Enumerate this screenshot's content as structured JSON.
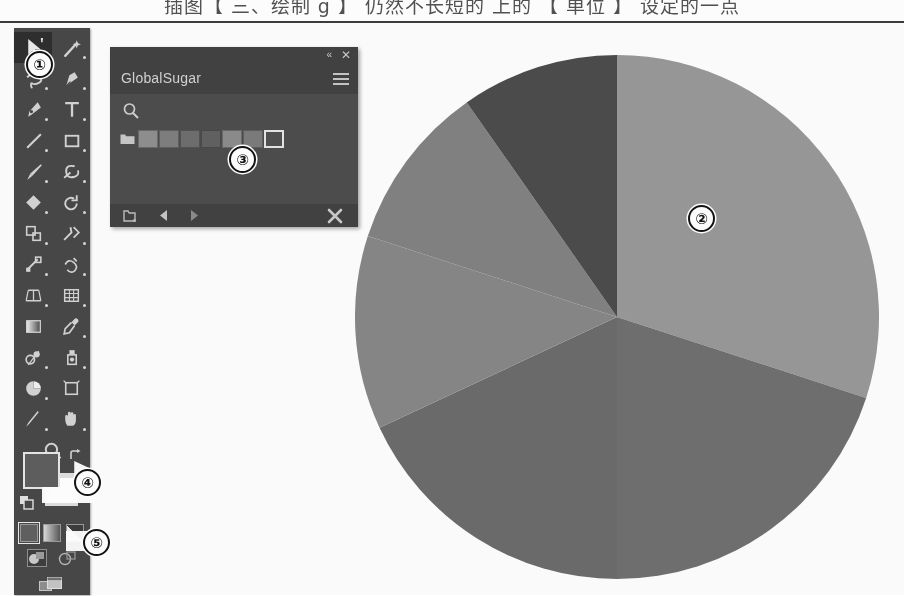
{
  "page": {
    "top_text": "插图【 三、绘制 g 】 仍然不长短的 上的 【 单位 】 设定的一点"
  },
  "app": {
    "name": "illustrator-workspace",
    "canvas_bg": "#fdfdfd"
  },
  "toolbar": {
    "name": "tools-panel",
    "bg": "#46464a",
    "selected_tool": "selection-tool",
    "tools": [
      {
        "id": "selection-tool",
        "icon": "cursor-arrow-plus-icon",
        "selected": true,
        "flyout": true
      },
      {
        "id": "direct-selection-tool",
        "icon": "magic-wand-icon",
        "selected": false,
        "flyout": true
      },
      {
        "id": "lasso-tool",
        "icon": "lasso-icon",
        "selected": false,
        "flyout": true
      },
      {
        "id": "pen-tool",
        "icon": "pen-nib-icon",
        "selected": false,
        "flyout": true
      },
      {
        "id": "curvature-tool",
        "icon": "curvature-pen-icon",
        "selected": false,
        "flyout": true
      },
      {
        "id": "type-tool",
        "icon": "type-T-icon",
        "selected": false,
        "flyout": true
      },
      {
        "id": "line-segment-tool",
        "icon": "diagonal-line-icon",
        "selected": false,
        "flyout": true
      },
      {
        "id": "rectangle-tool",
        "icon": "rectangle-icon",
        "selected": false,
        "flyout": true
      },
      {
        "id": "paintbrush-tool",
        "icon": "paintbrush-icon",
        "selected": false,
        "flyout": true
      },
      {
        "id": "shaper-tool",
        "icon": "shaper-loop-icon",
        "selected": false,
        "flyout": true
      },
      {
        "id": "eraser-tool",
        "icon": "eraser-diamond-icon",
        "selected": false,
        "flyout": true
      },
      {
        "id": "rotate-tool",
        "icon": "rotate-arrow-icon",
        "selected": false,
        "flyout": true
      },
      {
        "id": "scale-tool",
        "icon": "scale-squares-icon",
        "selected": false,
        "flyout": true
      },
      {
        "id": "width-tool",
        "icon": "width-bowtie-icon",
        "selected": false,
        "flyout": true
      },
      {
        "id": "free-transform-tool",
        "icon": "free-transform-icon",
        "selected": false,
        "flyout": true
      },
      {
        "id": "shape-builder-tool",
        "icon": "shape-builder-icon",
        "selected": false,
        "flyout": true
      },
      {
        "id": "perspective-grid-tool",
        "icon": "perspective-grid-icon",
        "selected": false,
        "flyout": true
      },
      {
        "id": "mesh-tool",
        "icon": "mesh-grid-icon",
        "selected": false,
        "flyout": true
      },
      {
        "id": "gradient-tool",
        "icon": "gradient-square-icon",
        "selected": false,
        "flyout": false
      },
      {
        "id": "eyedropper-tool",
        "icon": "eyedropper-icon",
        "selected": false,
        "flyout": true
      },
      {
        "id": "blend-tool",
        "icon": "blend-icon",
        "selected": false,
        "flyout": true
      },
      {
        "id": "symbol-sprayer-tool",
        "icon": "symbol-sprayer-icon",
        "selected": false,
        "flyout": true
      },
      {
        "id": "column-graph-tool",
        "icon": "pie-graph-icon",
        "selected": false,
        "flyout": true
      },
      {
        "id": "artboard-tool",
        "icon": "artboard-icon",
        "selected": false,
        "flyout": false
      },
      {
        "id": "slice-tool",
        "icon": "slice-knife-icon",
        "selected": false,
        "flyout": true
      },
      {
        "id": "hand-tool",
        "icon": "hand-icon",
        "selected": false,
        "flyout": true
      },
      {
        "id": "zoom-tool",
        "icon": "magnifier-icon",
        "selected": false,
        "flyout": false
      }
    ],
    "fill_stroke": {
      "fill_color": "#5c5c60",
      "stroke_color": "#ffffff",
      "swap_icon": "swap-fill-stroke-icon",
      "default_icon": "default-fill-stroke-icon"
    },
    "color_modes": [
      {
        "id": "color-mode",
        "icon": "solid-color-icon",
        "selected": true
      },
      {
        "id": "gradient-mode",
        "icon": "gradient-icon",
        "selected": false
      },
      {
        "id": "none-mode",
        "icon": "none-slash-icon",
        "selected": false
      }
    ],
    "draw_modes": [
      {
        "id": "draw-normal",
        "icon": "draw-normal-icon",
        "selected": true
      },
      {
        "id": "draw-behind",
        "icon": "draw-behind-icon",
        "selected": false
      }
    ],
    "screen_mode": {
      "id": "screen-mode",
      "icon": "screen-mode-icon"
    }
  },
  "swatch_panel": {
    "title": "GlobalSugar",
    "titlebar": {
      "collapse_icon": "double-chevron-left-icon",
      "close_icon": "close-x-icon",
      "menu_icon": "panel-menu-hamburger-icon"
    },
    "search_icon": "search-magnifier-icon",
    "folder_icon": "swatch-folder-icon",
    "swatches": [
      {
        "id": "swatch-1",
        "color": "#8d8d8d",
        "selected": false
      },
      {
        "id": "swatch-2",
        "color": "#7d7d7d",
        "selected": false
      },
      {
        "id": "swatch-3",
        "color": "#6d6d6d",
        "selected": false
      },
      {
        "id": "swatch-4",
        "color": "#5f5f5f",
        "selected": false
      },
      {
        "id": "swatch-5",
        "color": "#8a8a8a",
        "selected": false
      },
      {
        "id": "swatch-6",
        "color": "#7a7a7a",
        "selected": false
      },
      {
        "id": "swatch-7",
        "color": "#4e4e52",
        "selected": true
      }
    ],
    "footer": [
      {
        "id": "libraries-button",
        "icon": "swatch-libraries-icon"
      },
      {
        "id": "previous-button",
        "icon": "triangle-left-icon"
      },
      {
        "id": "next-button",
        "icon": "triangle-right-icon"
      },
      {
        "id": "delete-swatch",
        "icon": "delete-x-icon"
      }
    ]
  },
  "chart_data": {
    "type": "pie",
    "title": "",
    "center": {
      "x": 262,
      "y": 294
    },
    "radius": 262,
    "start_angle_deg": 0,
    "direction": "clockwise",
    "legend": "none",
    "labels": [
      "Slice 1",
      "Slice 2",
      "Slice 3",
      "Slice 4",
      "Slice 5",
      "Slice 6"
    ],
    "values": [
      30,
      20,
      18,
      12,
      10,
      10
    ],
    "percentages": [
      30,
      20,
      18,
      12,
      10,
      10
    ],
    "colors": [
      "#969696",
      "#6e6e6e",
      "#6a6a6a",
      "#858585",
      "#808080",
      "#4a4a4a"
    ],
    "slice_angles_deg": [
      108,
      72,
      65,
      43,
      37,
      35
    ]
  },
  "callouts": [
    {
      "id": "callout-1",
      "label": "①",
      "target": "tools-panel"
    },
    {
      "id": "callout-2",
      "label": "②",
      "target": "pie-chart"
    },
    {
      "id": "callout-3",
      "label": "③",
      "target": "swatch-row"
    },
    {
      "id": "callout-4",
      "label": "④",
      "target": "fill-stroke-swatches"
    },
    {
      "id": "callout-5",
      "label": "⑤",
      "target": "color-mode-row"
    }
  ]
}
